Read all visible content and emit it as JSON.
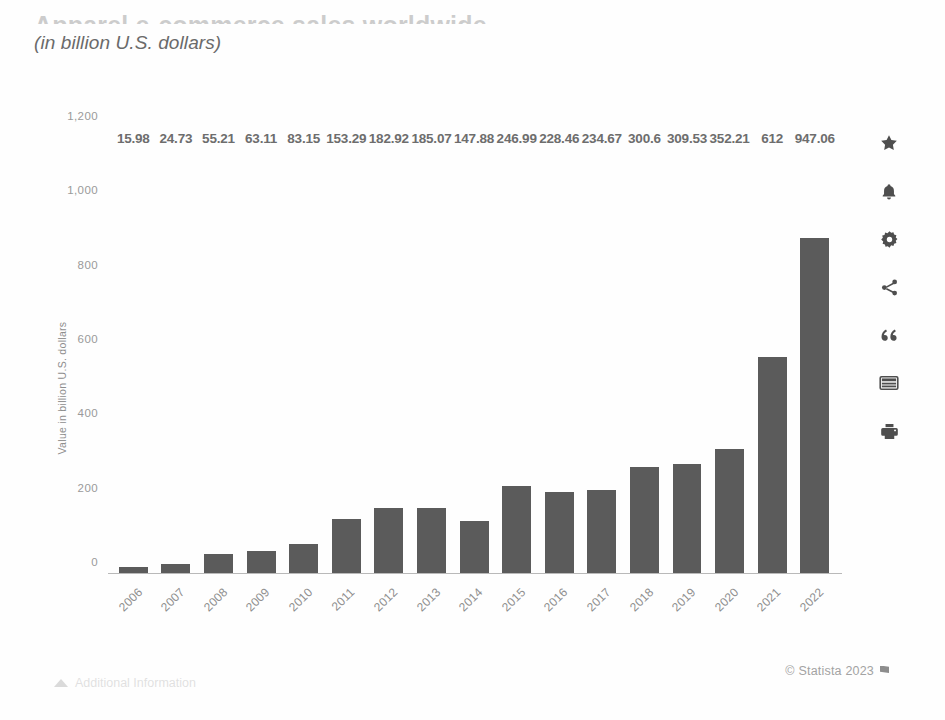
{
  "header": {
    "title": "Apparel e-commerce sales worldwide",
    "subtitle": "(in billion U.S. dollars)"
  },
  "chart_data": {
    "type": "bar",
    "title": "Apparel e-commerce sales worldwide",
    "subtitle": "(in billion U.S. dollars)",
    "xlabel": "",
    "ylabel": "Value in billion U.S. dollars",
    "ylim": [
      0,
      1200
    ],
    "yticks": [
      "0",
      "200",
      "400",
      "600",
      "800",
      "1,000",
      "1,200"
    ],
    "ytick_values": [
      0,
      200,
      400,
      600,
      800,
      1000,
      1200
    ],
    "grid": false,
    "legend": null,
    "bar_color": "#5b5b5b",
    "categories": [
      "2006",
      "2007",
      "2008",
      "2009",
      "2010",
      "2011",
      "2012",
      "2013",
      "2014",
      "2015",
      "2016",
      "2017",
      "2018",
      "2019",
      "2020",
      "2021",
      "2022"
    ],
    "values": [
      15.98,
      24.73,
      55.21,
      63.11,
      83.15,
      153.29,
      182.92,
      185.07,
      147.88,
      246.99,
      228.46,
      234.67,
      300.6,
      309.53,
      352.21,
      612,
      947.06
    ],
    "value_labels": [
      "15.98",
      "24.73",
      "55.21",
      "63.11",
      "83.15",
      "153.29",
      "182.92",
      "185.07",
      "147.88",
      "246.99",
      "228.46",
      "234.67",
      "300.6",
      "309.53",
      "352.21",
      "612",
      "947.06"
    ]
  },
  "toolbar": {
    "icons": [
      {
        "name": "favorite-star-icon",
        "label": "Add to favorites"
      },
      {
        "name": "bell-icon",
        "label": "Notifications"
      },
      {
        "name": "gear-icon",
        "label": "Settings"
      },
      {
        "name": "share-icon",
        "label": "Share"
      },
      {
        "name": "quote-icon",
        "label": "Cite"
      },
      {
        "name": "table-icon",
        "label": "Show data table"
      },
      {
        "name": "print-icon",
        "label": "Print"
      }
    ]
  },
  "footer": {
    "credit": "© Statista 2023",
    "info_link": "Additional Information"
  }
}
